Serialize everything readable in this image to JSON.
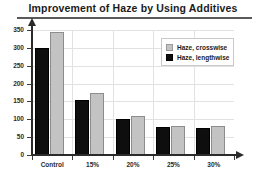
{
  "chart_data": {
    "type": "bar",
    "title": "Improvement of  Haze  by Using Additives",
    "xlabel": "",
    "ylabel": "",
    "categories": [
      "Control",
      "15%",
      "20%",
      "25%",
      "30%"
    ],
    "series": [
      {
        "name": "Haze, crosswise",
        "color": "#c3c3c3",
        "values": [
          345,
          175,
          110,
          80,
          80
        ]
      },
      {
        "name": "Haze, lengthwise",
        "color": "#0e0e0e",
        "values": [
          300,
          155,
          100,
          78,
          77
        ]
      }
    ],
    "draw_order": [
      "Haze, lengthwise",
      "Haze, crosswise"
    ],
    "ylim": [
      0,
      350
    ],
    "yticks": [
      0,
      50,
      100,
      150,
      200,
      250,
      300,
      350
    ],
    "ytick_labels": [
      "0",
      "50",
      "100",
      "150",
      "200",
      "250",
      "300",
      "350"
    ],
    "grid": true,
    "legend_position": "top-right"
  },
  "legend": {
    "items": [
      {
        "label": "Haze, crosswise"
      },
      {
        "label": "Haze, lengthwise"
      }
    ]
  }
}
